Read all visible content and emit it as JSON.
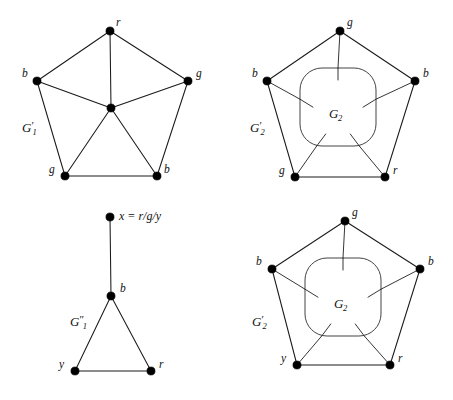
{
  "figure": {
    "background_color": "#ffffff",
    "ink_color": "#000000",
    "width": 453,
    "height": 400
  },
  "panels": [
    {
      "id": "top-left",
      "name": "G1-prime-graph",
      "label": "G",
      "label_prime": "′",
      "label_sub": "1",
      "label_pos": {
        "x": 22,
        "y": 121
      },
      "vertices": [
        {
          "id": "r-top",
          "label": "r",
          "x": 110,
          "y": 31,
          "lx": 116,
          "ly": 17,
          "anchor": "left"
        },
        {
          "id": "b-left",
          "label": "b",
          "x": 37,
          "y": 81,
          "lx": 22,
          "ly": 68,
          "anchor": "left"
        },
        {
          "id": "g-right",
          "label": "g",
          "x": 188,
          "y": 81,
          "lx": 196,
          "ly": 68,
          "anchor": "left"
        },
        {
          "id": "center",
          "label": "",
          "x": 111,
          "y": 108,
          "lx": 0,
          "ly": 0,
          "anchor": "none"
        },
        {
          "id": "g-bottom-left",
          "label": "g",
          "x": 65,
          "y": 176,
          "lx": 49,
          "ly": 164,
          "anchor": "left"
        },
        {
          "id": "b-bottom-right",
          "label": "b",
          "x": 157,
          "y": 176,
          "lx": 164,
          "ly": 164,
          "anchor": "left"
        }
      ],
      "edges": [
        [
          "r-top",
          "b-left"
        ],
        [
          "r-top",
          "g-right"
        ],
        [
          "r-top",
          "center"
        ],
        [
          "b-left",
          "center"
        ],
        [
          "b-left",
          "g-bottom-left"
        ],
        [
          "g-right",
          "center"
        ],
        [
          "g-right",
          "b-bottom-right"
        ],
        [
          "center",
          "g-bottom-left"
        ],
        [
          "center",
          "b-bottom-right"
        ],
        [
          "g-bottom-left",
          "b-bottom-right"
        ]
      ]
    },
    {
      "id": "top-right",
      "name": "G2-prime-graph-top",
      "label": "G",
      "label_prime": "′",
      "label_sub": "2",
      "label_pos": {
        "x": 250,
        "y": 121
      },
      "inner_label": "G",
      "inner_label_sub": "2",
      "inner_label_pos": {
        "x": 329,
        "y": 107
      },
      "blob": {
        "x": 300,
        "y": 68,
        "width": 76,
        "height": 78,
        "rx": 22
      },
      "vertices": [
        {
          "id": "g-top",
          "label": "g",
          "x": 340,
          "y": 31,
          "lx": 347,
          "ly": 17,
          "anchor": "left"
        },
        {
          "id": "b-left",
          "label": "b",
          "x": 267,
          "y": 81,
          "lx": 252,
          "ly": 68,
          "anchor": "left"
        },
        {
          "id": "b-right",
          "label": "b",
          "x": 415,
          "y": 81,
          "lx": 423,
          "ly": 68,
          "anchor": "left"
        },
        {
          "id": "g-bottom-left",
          "label": "g",
          "x": 295,
          "y": 177,
          "lx": 279,
          "ly": 165,
          "anchor": "left"
        },
        {
          "id": "r-bottom-right",
          "label": "r",
          "x": 385,
          "y": 177,
          "lx": 393,
          "ly": 165,
          "anchor": "left"
        }
      ],
      "edges": [
        [
          "g-top",
          "b-left"
        ],
        [
          "g-top",
          "b-right"
        ],
        [
          "b-left",
          "g-bottom-left"
        ],
        [
          "b-right",
          "r-bottom-right"
        ],
        [
          "g-bottom-left",
          "r-bottom-right"
        ]
      ],
      "spokes": [
        {
          "from": "g-top",
          "to_blob": "top"
        },
        {
          "from": "b-left",
          "to_blob": "left"
        },
        {
          "from": "b-right",
          "to_blob": "right"
        },
        {
          "from": "g-bottom-left",
          "to_blob": "bottom-left"
        },
        {
          "from": "r-bottom-right",
          "to_blob": "bottom-right"
        }
      ]
    },
    {
      "id": "bottom-left",
      "name": "G1-double-prime-graph",
      "label": "G",
      "label_prime": "″",
      "label_sub": "1",
      "label_pos": {
        "x": 70,
        "y": 315
      },
      "eq_label": "x = r/g/y",
      "eq_label_pos": {
        "x": 119,
        "y": 210
      },
      "vertices": [
        {
          "id": "x-top",
          "label": "",
          "x": 110,
          "y": 217,
          "lx": 0,
          "ly": 0,
          "anchor": "none"
        },
        {
          "id": "b-mid",
          "label": "b",
          "x": 111,
          "y": 296,
          "lx": 120,
          "ly": 283,
          "anchor": "left"
        },
        {
          "id": "y-bottom",
          "label": "y",
          "x": 75,
          "y": 371,
          "lx": 59,
          "ly": 359,
          "anchor": "left"
        },
        {
          "id": "r-bottom",
          "label": "r",
          "x": 151,
          "y": 371,
          "lx": 159,
          "ly": 359,
          "anchor": "left"
        }
      ],
      "edges": [
        [
          "x-top",
          "b-mid"
        ],
        [
          "b-mid",
          "y-bottom"
        ],
        [
          "b-mid",
          "r-bottom"
        ],
        [
          "y-bottom",
          "r-bottom"
        ]
      ]
    },
    {
      "id": "bottom-right",
      "name": "G2-prime-graph-bottom",
      "label": "G",
      "label_prime": "′",
      "label_sub": "2",
      "label_pos": {
        "x": 252,
        "y": 315
      },
      "inner_label": "G",
      "inner_label_sub": "2",
      "inner_label_pos": {
        "x": 334,
        "y": 297
      },
      "blob": {
        "x": 305,
        "y": 258,
        "width": 76,
        "height": 78,
        "rx": 22
      },
      "vertices": [
        {
          "id": "g-top",
          "label": "g",
          "x": 345,
          "y": 221,
          "lx": 352,
          "ly": 207,
          "anchor": "left"
        },
        {
          "id": "b-left",
          "label": "b",
          "x": 272,
          "y": 269,
          "lx": 256,
          "ly": 256,
          "anchor": "left"
        },
        {
          "id": "b-right",
          "label": "b",
          "x": 420,
          "y": 269,
          "lx": 428,
          "ly": 256,
          "anchor": "left"
        },
        {
          "id": "y-bottom-left",
          "label": "y",
          "x": 297,
          "y": 365,
          "lx": 281,
          "ly": 353,
          "anchor": "left"
        },
        {
          "id": "r-bottom-right",
          "label": "r",
          "x": 390,
          "y": 365,
          "lx": 398,
          "ly": 353,
          "anchor": "left"
        }
      ],
      "edges": [
        [
          "g-top",
          "b-left"
        ],
        [
          "g-top",
          "b-right"
        ],
        [
          "b-left",
          "y-bottom-left"
        ],
        [
          "b-right",
          "r-bottom-right"
        ],
        [
          "y-bottom-left",
          "r-bottom-right"
        ]
      ],
      "spokes": [
        {
          "from": "g-top",
          "to_blob": "top"
        },
        {
          "from": "b-left",
          "to_blob": "left"
        },
        {
          "from": "b-right",
          "to_blob": "right"
        },
        {
          "from": "y-bottom-left",
          "to_blob": "bottom-left"
        },
        {
          "from": "r-bottom-right",
          "to_blob": "bottom-right"
        }
      ]
    }
  ]
}
